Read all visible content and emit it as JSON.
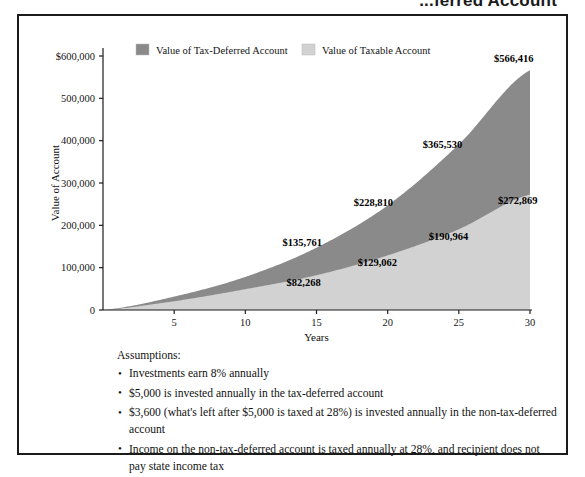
{
  "headline": "...ferred Account",
  "chart_data": {
    "type": "area",
    "title": "",
    "xlabel": "Years",
    "ylabel": "Value of Account",
    "x": [
      0,
      5,
      10,
      15,
      20,
      25,
      30
    ],
    "xlim": [
      0,
      30
    ],
    "ylim": [
      0,
      600000
    ],
    "xticks": [
      "5",
      "10",
      "15",
      "20",
      "25",
      "30"
    ],
    "xtick_values": [
      5,
      10,
      15,
      20,
      25,
      30
    ],
    "yticks": [
      "0",
      "100,000",
      "200,000",
      "300,000",
      "400,000",
      "500,000",
      "$600,000"
    ],
    "ytick_values": [
      0,
      100000,
      200000,
      300000,
      400000,
      500000,
      600000
    ],
    "grid": false,
    "legend_position": "top",
    "series": [
      {
        "name": "Value of Tax-Deferred Account",
        "color": "#8a8a8a",
        "values": [
          0,
          31680,
          78227,
          147304,
          247115,
          391340,
          566416
        ],
        "labels": [
          {
            "x": 15,
            "value": 135761,
            "text": "$135,761"
          },
          {
            "x": 20,
            "value": 228810,
            "text": "$228,810"
          },
          {
            "x": 25,
            "value": 365530,
            "text": "$365,530"
          },
          {
            "x": 30,
            "value": 566416,
            "text": "$566,416"
          }
        ]
      },
      {
        "name": "Value of Taxable Account",
        "color": "#d2d2d2",
        "values": [
          0,
          20800,
          49200,
          82268,
          129062,
          190964,
          272869
        ],
        "labels": [
          {
            "x": 15,
            "value": 82268,
            "text": "$82,268"
          },
          {
            "x": 20,
            "value": 129062,
            "text": "$129,062"
          },
          {
            "x": 25,
            "value": 190964,
            "text": "$190,964"
          },
          {
            "x": 30,
            "value": 272869,
            "text": "$272,869"
          }
        ]
      }
    ]
  },
  "legend": {
    "items": [
      {
        "label": "Value of Tax-Deferred Account",
        "color": "#8a8a8a"
      },
      {
        "label": "Value of Taxable Account",
        "color": "#d2d2d2"
      }
    ]
  },
  "assumptions": {
    "title": "Assumptions:",
    "bullet_glyph": "•",
    "items": [
      "Investments earn 8% annually",
      "$5,000 is invested annually in the tax-deferred account",
      "$3,600 (what's left after $5,000 is taxed at 28%) is invested annually in the non-tax-deferred account",
      "Income on the non-tax-deferred account is taxed annually at 28%, and recipient does not pay state income tax"
    ]
  }
}
